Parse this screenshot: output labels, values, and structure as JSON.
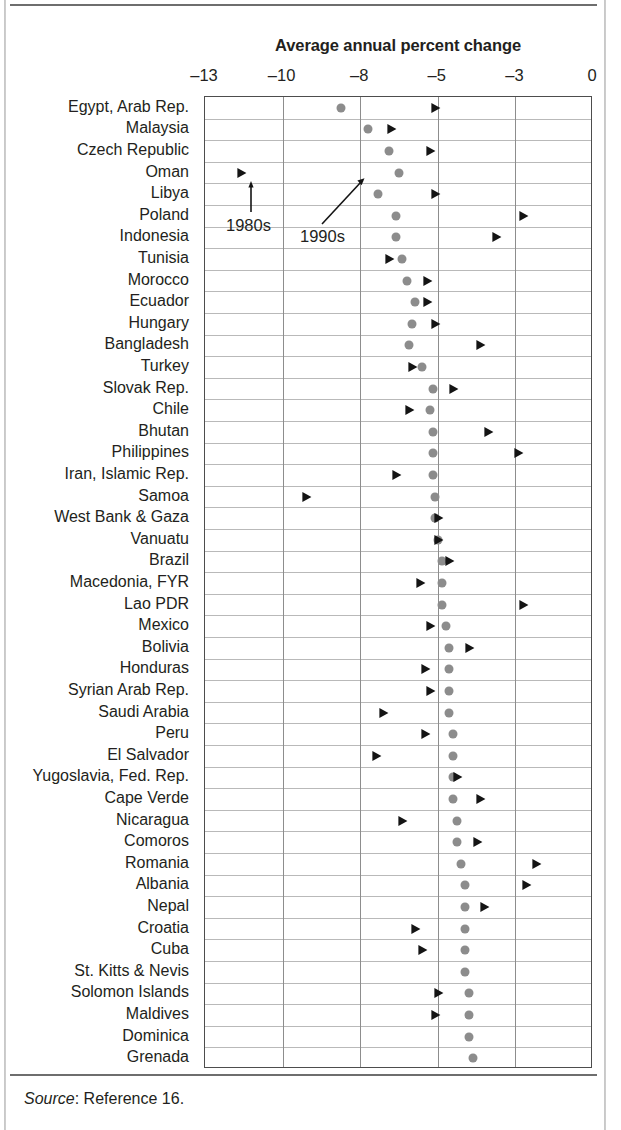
{
  "figure": {
    "title": "Average annual percent change",
    "source_prefix": "Source",
    "source_text": ": Reference 16."
  },
  "annotations": [
    {
      "name": "anno-1980s",
      "label": "1980s"
    },
    {
      "name": "anno-1990s",
      "label": "1990s"
    }
  ],
  "chart_data": {
    "type": "scatter",
    "title": "Average annual percent change",
    "xlabel": "",
    "ylabel": "",
    "grid": true,
    "legend_position": "inline-annotations",
    "series": [
      {
        "name": "1980s",
        "marker": "circle",
        "color": "#8c8c8c"
      },
      {
        "name": "1990s",
        "marker": "triangle-right",
        "color": "#141414"
      }
    ],
    "xticks": [
      -13,
      -10,
      -8,
      -5,
      -3,
      0
    ],
    "xtick_labels": [
      "–13",
      "–10",
      "–8",
      "–5",
      "–3",
      "0"
    ],
    "xtick_spacing": "even",
    "categories": [
      "Egypt, Arab Rep.",
      "Malaysia",
      "Czech Republic",
      "Oman",
      "Libya",
      "Poland",
      "Indonesia",
      "Tunisia",
      "Morocco",
      "Ecuador",
      "Hungary",
      "Bangladesh",
      "Turkey",
      "Slovak Rep.",
      "Chile",
      "Bhutan",
      "Philippines",
      "Iran, Islamic Rep.",
      "Samoa",
      "West Bank & Gaza",
      "Vanuatu",
      "Brazil",
      "Macedonia, FYR",
      "Lao PDR",
      "Mexico",
      "Bolivia",
      "Honduras",
      "Syrian Arab Rep.",
      "Saudi Arabia",
      "Peru",
      "El Salvador",
      "Yugoslavia, Fed. Rep.",
      "Cape Verde",
      "Nicaragua",
      "Comoros",
      "Romania",
      "Albania",
      "Nepal",
      "Croatia",
      "Cuba",
      "St. Kitts & Nevis",
      "Solomon Islands",
      "Maldives",
      "Dominica",
      "Grenada"
    ],
    "rows": [
      {
        "label": "Egypt, Arab Rep.",
        "v1980s": -8.5,
        "v1990s": -5.1
      },
      {
        "label": "Malaysia",
        "v1980s": -7.7,
        "v1990s": -6.8
      },
      {
        "label": "Czech Republic",
        "v1980s": -6.9,
        "v1990s": -5.3
      },
      {
        "label": "Oman",
        "v1980s": -6.5,
        "v1990s": -11.6
      },
      {
        "label": "Libya",
        "v1980s": -7.3,
        "v1990s": -5.1
      },
      {
        "label": "Poland",
        "v1980s": -6.6,
        "v1990s": -2.7
      },
      {
        "label": "Indonesia",
        "v1980s": -6.6,
        "v1990s": -3.5
      },
      {
        "label": "Tunisia",
        "v1980s": -6.4,
        "v1990s": -6.9
      },
      {
        "label": "Morocco",
        "v1980s": -6.2,
        "v1990s": -5.4
      },
      {
        "label": "Ecuador",
        "v1980s": -5.9,
        "v1990s": -5.4
      },
      {
        "label": "Hungary",
        "v1980s": -6.0,
        "v1990s": -5.1
      },
      {
        "label": "Bangladesh",
        "v1980s": -6.1,
        "v1990s": -3.9
      },
      {
        "label": "Turkey",
        "v1980s": -5.6,
        "v1990s": -6.0
      },
      {
        "label": "Slovak Rep.",
        "v1980s": -5.2,
        "v1990s": -4.6
      },
      {
        "label": "Chile",
        "v1980s": -5.3,
        "v1990s": -6.1
      },
      {
        "label": "Bhutan",
        "v1980s": -5.2,
        "v1990s": -3.7
      },
      {
        "label": "Philippines",
        "v1980s": -5.2,
        "v1990s": -2.9
      },
      {
        "label": "Iran, Islamic Rep.",
        "v1980s": -5.2,
        "v1990s": -6.6
      },
      {
        "label": "Samoa",
        "v1980s": -5.1,
        "v1990s": -9.4
      },
      {
        "label": "West Bank & Gaza",
        "v1980s": -5.1,
        "v1990s": -5.0
      },
      {
        "label": "Vanuatu",
        "v1980s": -5.0,
        "v1990s": -5.0
      },
      {
        "label": "Brazil",
        "v1980s": -4.9,
        "v1990s": -4.7
      },
      {
        "label": "Macedonia, FYR",
        "v1980s": -4.9,
        "v1990s": -5.7
      },
      {
        "label": "Lao PDR",
        "v1980s": -4.9,
        "v1990s": -2.7
      },
      {
        "label": "Mexico",
        "v1980s": -4.8,
        "v1990s": -5.3
      },
      {
        "label": "Bolivia",
        "v1980s": -4.7,
        "v1990s": -4.2
      },
      {
        "label": "Honduras",
        "v1980s": -4.7,
        "v1990s": -5.5
      },
      {
        "label": "Syrian Arab Rep.",
        "v1980s": -4.7,
        "v1990s": -5.3
      },
      {
        "label": "Saudi Arabia",
        "v1980s": -4.7,
        "v1990s": -7.1
      },
      {
        "label": "Peru",
        "v1980s": -4.6,
        "v1990s": -5.5
      },
      {
        "label": "El Salvador",
        "v1980s": -4.6,
        "v1990s": -7.4
      },
      {
        "label": "Yugoslavia, Fed. Rep.",
        "v1980s": -4.6,
        "v1990s": -4.5
      },
      {
        "label": "Cape Verde",
        "v1980s": -4.6,
        "v1990s": -3.9
      },
      {
        "label": "Nicaragua",
        "v1980s": -4.5,
        "v1990s": -6.4
      },
      {
        "label": "Comoros",
        "v1980s": -4.5,
        "v1990s": -4.0
      },
      {
        "label": "Romania",
        "v1980s": -4.4,
        "v1990s": -2.2
      },
      {
        "label": "Albania",
        "v1980s": -4.3,
        "v1990s": -2.6
      },
      {
        "label": "Nepal",
        "v1980s": -4.3,
        "v1990s": -3.8
      },
      {
        "label": "Croatia",
        "v1980s": -4.3,
        "v1990s": -5.9
      },
      {
        "label": "Cuba",
        "v1980s": -4.3,
        "v1990s": -5.6
      },
      {
        "label": "St. Kitts & Nevis",
        "v1980s": -4.3,
        "v1990s": null
      },
      {
        "label": "Solomon Islands",
        "v1980s": -4.2,
        "v1990s": -5.0
      },
      {
        "label": "Maldives",
        "v1980s": -4.2,
        "v1990s": -5.1
      },
      {
        "label": "Dominica",
        "v1980s": -4.2,
        "v1990s": null
      },
      {
        "label": "Grenada",
        "v1980s": -4.1,
        "v1990s": null
      }
    ]
  }
}
